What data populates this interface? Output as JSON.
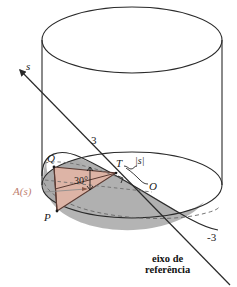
{
  "figure": {
    "type": "geometric-diagram",
    "language": "pt-BR",
    "labels": {
      "s_axis": "s",
      "radius_top": "3",
      "radius_bottom": "-3",
      "point_Q": "Q",
      "point_P": "P",
      "point_T": "T",
      "point_O": "O",
      "distance_s": "|s|",
      "angle": "30°",
      "area_function": "A(s)",
      "reference_axis_line1": "eixo de",
      "reference_axis_line2": "referência"
    },
    "colors": {
      "outline": "#2a2a2a",
      "shaded_disk": "#b0b0b0",
      "shaded_disk_dark": "#9a9a9a",
      "triangle_fill": "#ddb4a6",
      "triangle_edge": "#5a3a32",
      "area_label": "#c08070",
      "background": "#ffffff",
      "dashed": "#6a6a6a"
    },
    "geometry": {
      "cylinder_top_center": [
        132,
        40
      ],
      "cylinder_bottom_center": [
        132,
        185
      ],
      "cylinder_rx": 90,
      "cylinder_ry": 33,
      "cylinder_height": 145,
      "triangle_vertices": {
        "Q": [
          54,
          167
        ],
        "P": [
          57,
          211
        ],
        "T": [
          116,
          173
        ]
      },
      "axis_start": [
        18,
        68
      ],
      "axis_end": [
        228,
        283
      ],
      "angle_value_degrees": 30,
      "radius_value": 3
    }
  }
}
